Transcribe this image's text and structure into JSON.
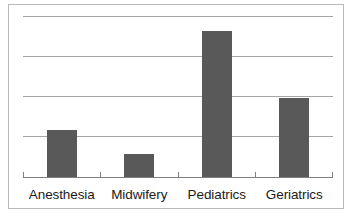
{
  "chart_data": {
    "type": "bar",
    "title": "",
    "subtitle": "",
    "xlabel": "",
    "ylabel": "",
    "categories": [
      "Anesthesia",
      "Midwifery",
      "Pediatrics",
      "Geriatrics"
    ],
    "values": [
      1.2,
      0.6,
      3.65,
      2.0
    ],
    "series": [
      {
        "name": "",
        "values": [
          1.2,
          0.6,
          3.65,
          2.0
        ]
      }
    ],
    "ylim": [
      0,
      4.05
    ],
    "ytick_values": [
      1,
      2,
      3,
      4
    ],
    "ytick_labels": [
      "",
      "",
      "",
      ""
    ],
    "gridlines": {
      "horizontal": true,
      "vertical": false,
      "count": 4,
      "color": "#a6a6a6"
    },
    "legend": {
      "visible": false,
      "position": "none",
      "entries": []
    },
    "axes": {
      "x_axis_visible": true,
      "x_axis_color": "#7f7f7f",
      "x_tick_marks": true,
      "y_axis_visible": false,
      "y_tick_labels_visible": false
    },
    "colors": {
      "bar_fill": "#595959",
      "plot_background": "#ffffff",
      "frame_border": "#b9b9b9",
      "gridline": "#a6a6a6",
      "axis": "#7f7f7f",
      "label_text": "#1a1a1a"
    },
    "annotations": [],
    "data_labels_visible": false
  },
  "figure": {
    "frame_visible": true,
    "background": "#ffffff"
  }
}
